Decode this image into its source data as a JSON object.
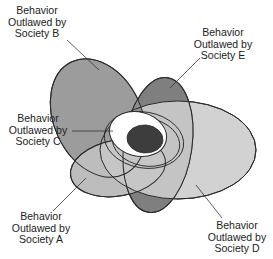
{
  "diagram": {
    "type": "overlapping-ellipses",
    "sets": [
      {
        "id": "A",
        "label_lines": [
          "Behavior",
          "Outlawed by",
          "Society A"
        ],
        "fill": "#bdbdbd"
      },
      {
        "id": "B",
        "label_lines": [
          "Behavior",
          "Outlawed by",
          "Society B"
        ],
        "fill": "#9c9c9c"
      },
      {
        "id": "C",
        "label_lines": [
          "Behavior",
          "Outlawed by",
          "Society C"
        ],
        "fill": "#ffffff"
      },
      {
        "id": "D",
        "label_lines": [
          "Behavior",
          "Outlawed by",
          "Society D"
        ],
        "fill": "#d2d2d2"
      },
      {
        "id": "E",
        "label_lines": [
          "Behavior",
          "Outlawed by",
          "Society E"
        ],
        "fill": "#7f7f7f"
      }
    ],
    "core": {
      "fill": "#3d3d3d",
      "description": "Behavior outlawed by all societies"
    },
    "stroke": "#2a2a2a"
  }
}
